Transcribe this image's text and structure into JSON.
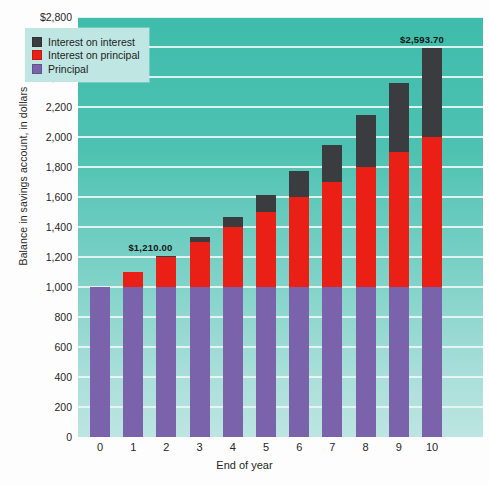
{
  "chart_data": {
    "type": "bar",
    "stacked": true,
    "title": "",
    "xlabel": "End of year",
    "ylabel": "Balance in savings account, in dollars",
    "categories": [
      "0",
      "1",
      "2",
      "3",
      "4",
      "5",
      "6",
      "7",
      "8",
      "9",
      "10"
    ],
    "ylim": [
      0,
      2800
    ],
    "ytick_labels": [
      "$2,800",
      "2,600",
      "2,400",
      "2,200",
      "2,000",
      "1,800",
      "1,600",
      "1,400",
      "1,200",
      "1,000",
      "800",
      "600",
      "400",
      "200",
      "0"
    ],
    "ytick_values": [
      2800,
      2600,
      2400,
      2200,
      2000,
      1800,
      1600,
      1400,
      1200,
      1000,
      800,
      600,
      400,
      200,
      0
    ],
    "grid": true,
    "legend_position": "upper left",
    "series": [
      {
        "name": "Principal",
        "color": "#7a63ab",
        "values": [
          1000,
          1000,
          1000,
          1000,
          1000,
          1000,
          1000,
          1000,
          1000,
          1000,
          1000
        ]
      },
      {
        "name": "Interest on principal",
        "color": "#ea2016",
        "values": [
          0,
          100,
          200,
          300,
          400,
          500,
          600,
          700,
          800,
          900,
          1000
        ]
      },
      {
        "name": "Interest on interest",
        "color": "#3a3c3f",
        "values": [
          0,
          0,
          10,
          31,
          64.1,
          110.51,
          171.56,
          248.72,
          343.59,
          457.95,
          593.7
        ]
      }
    ],
    "totals": [
      1000,
      1100,
      1210,
      1331,
      1464.1,
      1610.51,
      1771.56,
      1948.72,
      2143.59,
      2357.95,
      2593.7
    ],
    "annotations": [
      {
        "category": "2",
        "text": "$1,210.00",
        "value": 1210
      },
      {
        "category": "10",
        "text": "$2,593.70",
        "value": 2593.7
      }
    ]
  },
  "legend": {
    "items": [
      {
        "label": "Interest on interest",
        "color": "#3a3c3f"
      },
      {
        "label": "Interest on principal",
        "color": "#ea2016"
      },
      {
        "label": "Principal",
        "color": "#7a63ab"
      }
    ]
  },
  "colors": {
    "plot_background_top": "#3fbcab",
    "plot_background_bottom": "#bde5e1",
    "gridline": "#e9f6f4",
    "legend_background": "#bfe6e2",
    "page_background": "#fdfdfd"
  }
}
